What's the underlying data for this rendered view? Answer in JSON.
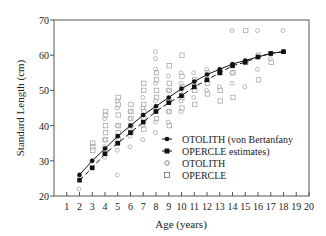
{
  "chart_data": {
    "type": "scatter",
    "title": "",
    "xlabel": "Age (years)",
    "ylabel": "Standard Length (cm)",
    "xlim": [
      0,
      20
    ],
    "ylim": [
      20,
      70
    ],
    "xticks": [
      1,
      2,
      3,
      4,
      5,
      6,
      7,
      8,
      9,
      10,
      11,
      12,
      13,
      14,
      15,
      16,
      17,
      18,
      19,
      20
    ],
    "yticks": [
      20,
      30,
      40,
      50,
      60,
      70
    ],
    "grid": false,
    "legend_position": "lower right",
    "legend": [
      {
        "label": "OTOLITH (von Bertanfany",
        "marker": "filled-circle",
        "line": "solid"
      },
      {
        "label": "OPERCLE  estimates)",
        "marker": "filled-square",
        "line": "dashed"
      },
      {
        "label": "OTOLITH",
        "marker": "open-circle",
        "line": "none"
      },
      {
        "label": "OPERCLE",
        "marker": "open-square",
        "line": "none"
      }
    ],
    "series": [
      {
        "name": "OTOLITH (von Bertanfany estimates)",
        "style": "solid-line-filled-circle",
        "x": [
          2,
          3,
          4,
          5,
          6,
          7,
          8,
          9,
          10,
          11,
          12,
          13,
          14,
          15,
          16,
          17,
          18
        ],
        "values": [
          26,
          30,
          33.5,
          37,
          40,
          43,
          45.5,
          48,
          50.5,
          52.5,
          54.5,
          56,
          57.5,
          58.5,
          59.5,
          60.5,
          61
        ]
      },
      {
        "name": "OPERCLE estimates",
        "style": "dashed-line-filled-square",
        "x": [
          2,
          3,
          4,
          5,
          6,
          7,
          8,
          9,
          10,
          11,
          12,
          13,
          14,
          15,
          16,
          17,
          18
        ],
        "values": [
          24.5,
          28,
          32,
          35,
          38,
          41,
          44,
          46.5,
          48.5,
          51,
          53,
          55,
          57,
          58,
          59.5,
          60.5,
          61
        ]
      },
      {
        "name": "OTOLITH",
        "style": "open-circle",
        "points": [
          [
            2,
            22
          ],
          [
            3,
            28
          ],
          [
            3,
            30
          ],
          [
            4,
            31
          ],
          [
            4,
            32
          ],
          [
            4,
            34
          ],
          [
            4,
            36
          ],
          [
            4,
            42
          ],
          [
            5,
            26
          ],
          [
            5,
            33
          ],
          [
            5,
            35
          ],
          [
            5,
            37
          ],
          [
            5,
            40
          ],
          [
            5,
            45
          ],
          [
            5,
            47
          ],
          [
            6,
            34
          ],
          [
            6,
            37
          ],
          [
            6,
            39
          ],
          [
            6,
            42
          ],
          [
            6,
            44
          ],
          [
            7,
            36
          ],
          [
            7,
            40
          ],
          [
            7,
            43
          ],
          [
            7,
            45
          ],
          [
            7,
            48
          ],
          [
            8,
            38
          ],
          [
            8,
            41
          ],
          [
            8,
            44
          ],
          [
            8,
            47
          ],
          [
            8,
            52
          ],
          [
            8,
            56
          ],
          [
            8,
            59
          ],
          [
            8,
            61
          ],
          [
            9,
            41
          ],
          [
            9,
            44
          ],
          [
            9,
            47
          ],
          [
            9,
            50
          ],
          [
            9,
            54
          ],
          [
            10,
            44
          ],
          [
            10,
            47
          ],
          [
            10,
            50
          ],
          [
            10,
            52
          ],
          [
            10,
            55
          ],
          [
            11,
            48
          ],
          [
            11,
            52
          ],
          [
            11,
            55
          ],
          [
            12,
            50
          ],
          [
            12,
            53
          ],
          [
            12,
            56
          ],
          [
            13,
            51
          ],
          [
            13,
            55
          ],
          [
            14,
            52
          ],
          [
            14,
            55
          ],
          [
            14,
            67
          ],
          [
            15,
            51
          ],
          [
            15,
            58
          ],
          [
            16,
            56
          ],
          [
            16,
            67
          ],
          [
            17,
            59
          ],
          [
            18,
            67
          ]
        ]
      },
      {
        "name": "OPERCLE",
        "style": "open-square",
        "points": [
          [
            3,
            33
          ],
          [
            3,
            34
          ],
          [
            3,
            35
          ],
          [
            4,
            33
          ],
          [
            4,
            36
          ],
          [
            4,
            38
          ],
          [
            4,
            40
          ],
          [
            4,
            43
          ],
          [
            4,
            44
          ],
          [
            5,
            36
          ],
          [
            5,
            38
          ],
          [
            5,
            40
          ],
          [
            5,
            43
          ],
          [
            5,
            46
          ],
          [
            5,
            48
          ],
          [
            6,
            38
          ],
          [
            6,
            40
          ],
          [
            6,
            42
          ],
          [
            6,
            44
          ],
          [
            6,
            46
          ],
          [
            7,
            39
          ],
          [
            7,
            42
          ],
          [
            7,
            44
          ],
          [
            7,
            46
          ],
          [
            7,
            50
          ],
          [
            7,
            52
          ],
          [
            8,
            42
          ],
          [
            8,
            45
          ],
          [
            8,
            48
          ],
          [
            8,
            50
          ],
          [
            8,
            53
          ],
          [
            8,
            55
          ],
          [
            9,
            40
          ],
          [
            9,
            44
          ],
          [
            9,
            47
          ],
          [
            9,
            50
          ],
          [
            9,
            52
          ],
          [
            9,
            57
          ],
          [
            10,
            45
          ],
          [
            10,
            48
          ],
          [
            10,
            51
          ],
          [
            10,
            54
          ],
          [
            10,
            60
          ],
          [
            11,
            46
          ],
          [
            11,
            50
          ],
          [
            11,
            53
          ],
          [
            12,
            49
          ],
          [
            12,
            52
          ],
          [
            12,
            55
          ],
          [
            13,
            47
          ],
          [
            13,
            50
          ],
          [
            13,
            55
          ],
          [
            14,
            48
          ],
          [
            14,
            55
          ],
          [
            15,
            58
          ],
          [
            15,
            67
          ],
          [
            16,
            53
          ],
          [
            16,
            60
          ],
          [
            17,
            58
          ]
        ]
      }
    ]
  },
  "axes": {
    "xlabel": "Age (years)",
    "ylabel": "Standard Length (cm)",
    "xtick_labels": [
      "1",
      "2",
      "3",
      "4",
      "5",
      "6",
      "7",
      "8",
      "9",
      "10",
      "11",
      "12",
      "13",
      "14",
      "15",
      "16",
      "17",
      "18",
      "19",
      "20"
    ],
    "ytick_labels": [
      "20",
      "30",
      "40",
      "50",
      "60",
      "70"
    ]
  },
  "legend": {
    "items": [
      {
        "label": "OTOLITH (von Bertanfany"
      },
      {
        "label": "OPERCLE  estimates)"
      },
      {
        "label": "OTOLITH"
      },
      {
        "label": "OPERCLE"
      }
    ]
  }
}
